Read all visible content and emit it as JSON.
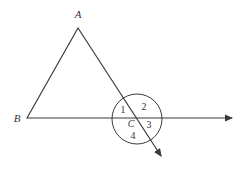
{
  "figure": {
    "background_color": "#ffffff",
    "stroke_color": "#3a3a3a",
    "label_color": "#333333"
  },
  "labels": {
    "vertex_a": "A",
    "vertex_b": "B",
    "point_c": "C",
    "angle_1": "1",
    "angle_2": "2",
    "angle_3": "3",
    "angle_4": "4"
  },
  "geometry": {
    "points": {
      "A": {
        "x": 78,
        "y": 28
      },
      "B": {
        "x": 27,
        "y": 118
      },
      "C": {
        "x": 137,
        "y": 118
      }
    },
    "rays": {
      "horizontal_ray": {
        "x1": 27,
        "y1": 118,
        "x2": 235,
        "y2": 118,
        "arrow": "end"
      },
      "diagonal_ray": {
        "x1": 78,
        "y1": 28,
        "x2": 165,
        "y2": 162,
        "arrow": "end"
      },
      "side_ab": {
        "x1": 78,
        "y1": 28,
        "x2": 27,
        "y2": 118,
        "arrow": "none"
      }
    },
    "circle": {
      "cx": 137,
      "cy": 119,
      "r": 25
    },
    "label_positions": {
      "A": {
        "x": 78,
        "y": 18
      },
      "B": {
        "x": 17,
        "y": 122
      },
      "C": {
        "x": 131,
        "y": 127
      },
      "1": {
        "x": 123,
        "y": 113
      },
      "2": {
        "x": 144,
        "y": 110
      },
      "3": {
        "x": 149,
        "y": 128
      },
      "4": {
        "x": 133,
        "y": 139
      }
    }
  }
}
